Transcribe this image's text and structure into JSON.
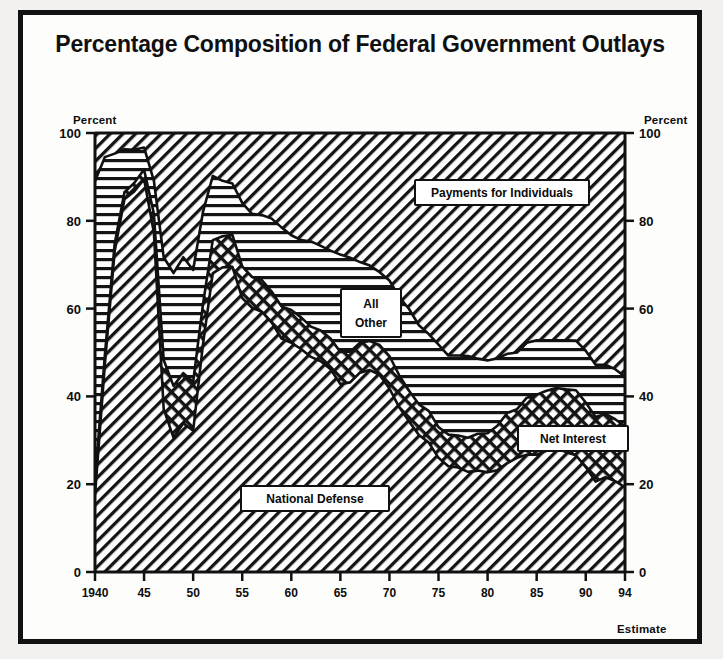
{
  "figure": {
    "title": "Percentage Composition of Federal Government Outlays",
    "left_axis_unit": "Percent",
    "right_axis_unit": "Percent",
    "estimate_note": "Estimate"
  },
  "labels": {
    "payments": "Payments for Individuals",
    "all_other_line1": "All",
    "all_other_line2": "Other",
    "net_interest": "Net Interest",
    "national_defense": "National Defense"
  },
  "colors": {
    "ink": "#111111",
    "paper": "#fdfdfc",
    "page": "#f2f1ef"
  },
  "chart_data": {
    "type": "area",
    "title": "Percentage Composition of Federal Government Outlays",
    "subtitle": "",
    "xlabel": "",
    "ylabel": "Percent",
    "xlim": [
      1940,
      1994
    ],
    "ylim": [
      0,
      100
    ],
    "grid": false,
    "legend": "inline-callouts",
    "stacked": true,
    "annotations": [
      "Estimate"
    ],
    "y_ticks": [
      0,
      20,
      40,
      60,
      80,
      100
    ],
    "x_ticks": [
      1940,
      45,
      50,
      55,
      60,
      65,
      70,
      75,
      80,
      85,
      90,
      94
    ],
    "x_tick_labels": [
      "1940",
      "45",
      "50",
      "55",
      "60",
      "65",
      "70",
      "75",
      "80",
      "85",
      "90",
      "94"
    ],
    "x": [
      1940,
      1941,
      1942,
      1943,
      1944,
      1945,
      1946,
      1947,
      1948,
      1949,
      1950,
      1951,
      1952,
      1953,
      1954,
      1955,
      1956,
      1957,
      1958,
      1959,
      1960,
      1961,
      1962,
      1963,
      1964,
      1965,
      1966,
      1967,
      1968,
      1969,
      1970,
      1971,
      1972,
      1973,
      1974,
      1975,
      1976,
      1977,
      1978,
      1979,
      1980,
      1981,
      1982,
      1983,
      1984,
      1985,
      1986,
      1987,
      1988,
      1989,
      1990,
      1991,
      1992,
      1993,
      1994
    ],
    "series": [
      {
        "name": "National Defense",
        "pattern": "diagonal-hatch",
        "values": [
          17.5,
          47.1,
          73.0,
          84.9,
          86.7,
          89.5,
          77.3,
          37.1,
          30.6,
          33.9,
          32.2,
          51.8,
          68.1,
          69.4,
          69.5,
          62.4,
          60.2,
          59.3,
          56.8,
          53.2,
          52.2,
          50.8,
          49.0,
          48.0,
          46.2,
          42.8,
          43.2,
          45.4,
          46.0,
          44.9,
          41.8,
          37.5,
          34.3,
          31.2,
          29.5,
          26.0,
          24.1,
          23.8,
          22.8,
          23.1,
          22.7,
          23.2,
          24.8,
          26.0,
          26.7,
          26.7,
          27.6,
          28.1,
          27.3,
          26.6,
          23.9,
          20.6,
          21.6,
          20.7,
          19.3
        ]
      },
      {
        "name": "Net Interest",
        "pattern": "cross-hatch",
        "values": [
          3.1,
          2.2,
          1.7,
          1.6,
          1.9,
          2.2,
          4.3,
          11.2,
          11.8,
          11.4,
          11.1,
          9.2,
          7.5,
          7.1,
          7.3,
          7.2,
          7.0,
          7.2,
          7.1,
          7.3,
          7.5,
          7.2,
          6.9,
          7.0,
          7.0,
          7.3,
          7.0,
          6.8,
          6.6,
          6.8,
          7.4,
          7.3,
          7.0,
          7.0,
          7.2,
          7.0,
          7.2,
          7.3,
          7.8,
          8.4,
          8.9,
          10.1,
          11.4,
          11.1,
          13.0,
          13.7,
          13.7,
          13.8,
          14.3,
          14.8,
          14.7,
          14.7,
          14.4,
          14.1,
          13.9
        ]
      },
      {
        "name": "All Other",
        "pattern": "horizontal-lines",
        "values": [
          68.4,
          45.2,
          20.6,
          9.8,
          7.6,
          5.0,
          7.5,
          23.4,
          25.7,
          26.4,
          25.5,
          21.0,
          14.6,
          12.6,
          11.7,
          14.5,
          14.4,
          14.8,
          16.6,
          18.0,
          17.0,
          17.6,
          19.4,
          19.3,
          20.0,
          22.2,
          21.4,
          18.4,
          17.2,
          16.6,
          17.2,
          17.8,
          18.6,
          18.0,
          17.5,
          18.8,
          18.0,
          18.2,
          18.6,
          17.1,
          16.6,
          15.4,
          13.5,
          12.9,
          12.5,
          12.4,
          11.5,
          10.9,
          11.2,
          11.3,
          11.8,
          11.9,
          11.2,
          11.4,
          11.3
        ]
      },
      {
        "name": "Payments for Individuals",
        "pattern": "diagonal-hatch",
        "values": [
          11.0,
          5.5,
          4.7,
          3.7,
          3.8,
          3.3,
          10.9,
          28.3,
          31.9,
          28.3,
          31.2,
          18.0,
          9.8,
          10.9,
          11.5,
          15.9,
          18.4,
          18.7,
          19.5,
          21.5,
          23.3,
          24.4,
          24.7,
          25.7,
          26.8,
          27.7,
          28.4,
          29.4,
          30.2,
          31.7,
          33.6,
          37.4,
          40.1,
          43.8,
          45.8,
          48.2,
          50.7,
          50.7,
          50.8,
          51.4,
          51.8,
          51.3,
          50.3,
          50.0,
          47.8,
          47.2,
          47.2,
          47.2,
          47.2,
          47.3,
          49.6,
          52.8,
          52.8,
          53.8,
          55.5
        ]
      }
    ],
    "stack_boundaries_note": "Cumulative tops: Defense, Defense+Net Interest, Defense+Net Interest+All Other, 100"
  }
}
